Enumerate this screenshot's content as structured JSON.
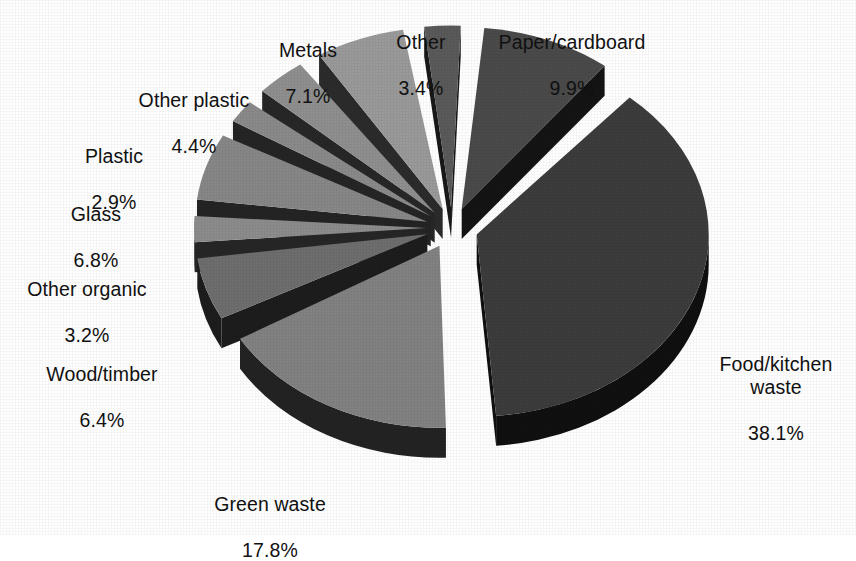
{
  "chart_data": {
    "type": "pie",
    "title": "",
    "subtitle": "",
    "xlabel": "",
    "ylabel": "",
    "legend_position": "none",
    "grid": false,
    "units": "percent",
    "style": "3d-exploded",
    "background_color": "#ffffff",
    "label_color": "#111111",
    "categories": [
      "Paper/cardboard",
      "Food/kitchen waste",
      "Green waste",
      "Wood/timber",
      "Other organic",
      "Glass",
      "Plastic",
      "Other plastic",
      "Metals",
      "Other"
    ],
    "values": [
      9.9,
      38.1,
      17.8,
      6.4,
      3.2,
      6.8,
      2.9,
      4.4,
      7.1,
      3.4
    ],
    "value_labels": [
      "9.9%",
      "38.1%",
      "17.8%",
      "6.4%",
      "3.2%",
      "6.8%",
      "2.9%",
      "4.4%",
      "7.1%",
      "3.4%"
    ],
    "slice_colors": [
      "#4a4a4a",
      "#3c3c3c",
      "#828282",
      "#6e6e6e",
      "#8c8c8c",
      "#878787",
      "#8a8a8a",
      "#8f8f8f",
      "#9a9a9a",
      "#5a5a5a"
    ],
    "slice_side_colors": [
      "#141414",
      "#101010",
      "#232323",
      "#1d1d1d",
      "#262626",
      "#242424",
      "#252525",
      "#272727",
      "#2b2b2b",
      "#181818"
    ],
    "slices": [
      {
        "label": "Paper/cardboard",
        "value": 9.9,
        "value_label": "9.9%",
        "color": "#4a4a4a",
        "side_color": "#141414"
      },
      {
        "label": "Food/kitchen waste",
        "value": 38.1,
        "value_label": "38.1%",
        "color": "#3c3c3c",
        "side_color": "#101010"
      },
      {
        "label": "Green waste",
        "value": 17.8,
        "value_label": "17.8%",
        "color": "#828282",
        "side_color": "#232323"
      },
      {
        "label": "Wood/timber",
        "value": 6.4,
        "value_label": "6.4%",
        "color": "#6e6e6e",
        "side_color": "#1d1d1d"
      },
      {
        "label": "Other organic",
        "value": 3.2,
        "value_label": "3.2%",
        "color": "#8c8c8c",
        "side_color": "#262626"
      },
      {
        "label": "Glass",
        "value": 6.8,
        "value_label": "6.8%",
        "color": "#878787",
        "side_color": "#242424"
      },
      {
        "label": "Plastic",
        "value": 2.9,
        "value_label": "2.9%",
        "color": "#8a8a8a",
        "side_color": "#252525"
      },
      {
        "label": "Other plastic",
        "value": 4.4,
        "value_label": "4.4%",
        "color": "#8f8f8f",
        "side_color": "#272727"
      },
      {
        "label": "Metals",
        "value": 7.1,
        "value_label": "7.1%",
        "color": "#9a9a9a",
        "side_color": "#2b2b2b"
      },
      {
        "label": "Other",
        "value": 3.4,
        "value_label": "3.4%",
        "color": "#5a5a5a",
        "side_color": "#181818"
      }
    ],
    "total": 100.0
  },
  "labels": {
    "paper_cardboard": {
      "name": "Paper/cardboard",
      "value": "9.9%"
    },
    "food_kitchen_waste": {
      "name": "Food/kitchen\nwaste",
      "value": "38.1%"
    },
    "green_waste": {
      "name": "Green waste",
      "value": "17.8%"
    },
    "wood_timber": {
      "name": "Wood/timber",
      "value": "6.4%"
    },
    "other_organic": {
      "name": "Other organic",
      "value": "3.2%"
    },
    "glass": {
      "name": "Glass",
      "value": "6.8%"
    },
    "plastic": {
      "name": "Plastic",
      "value": "2.9%"
    },
    "other_plastic": {
      "name": "Other plastic",
      "value": "4.4%"
    },
    "metals": {
      "name": "Metals",
      "value": "7.1%"
    },
    "other": {
      "name": "Other",
      "value": "3.4%"
    }
  }
}
